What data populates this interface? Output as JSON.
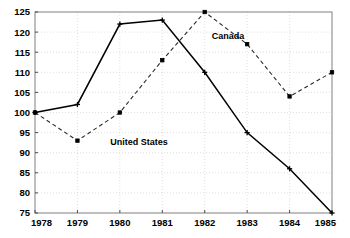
{
  "chart_data": {
    "type": "line",
    "title": "",
    "xlabel": "",
    "ylabel": "",
    "categories": [
      "1978",
      "1979",
      "1980",
      "1981",
      "1982",
      "1983",
      "1984",
      "1985"
    ],
    "x": [
      1978,
      1979,
      1980,
      1981,
      1982,
      1983,
      1984,
      1985
    ],
    "xlim": [
      1978,
      1985
    ],
    "ylim": [
      75,
      125
    ],
    "y_ticks": [
      75,
      80,
      85,
      90,
      95,
      100,
      105,
      110,
      115,
      120,
      125
    ],
    "x_ticks": [
      "1978",
      "1979",
      "1980",
      "1981",
      "1982",
      "1983",
      "1984",
      "1985"
    ],
    "grid": true,
    "legend_position": "inline-annotations",
    "series": [
      {
        "name": "United States",
        "style": "solid",
        "color": "#000000",
        "values": [
          100,
          102,
          122,
          123,
          110,
          95,
          86,
          75
        ]
      },
      {
        "name": "Canada",
        "style": "dashed",
        "color": "#2b2b2b",
        "values": [
          100,
          93,
          100,
          113,
          125,
          117,
          104,
          110
        ]
      }
    ],
    "annotations": [
      {
        "text": "Canada",
        "x": 1982.55,
        "y": 118.2
      },
      {
        "text": "United States",
        "x": 1980.45,
        "y": 92.0
      }
    ]
  },
  "plot_geometry": {
    "left": 35,
    "right": 332,
    "top": 12,
    "bottom": 213
  }
}
